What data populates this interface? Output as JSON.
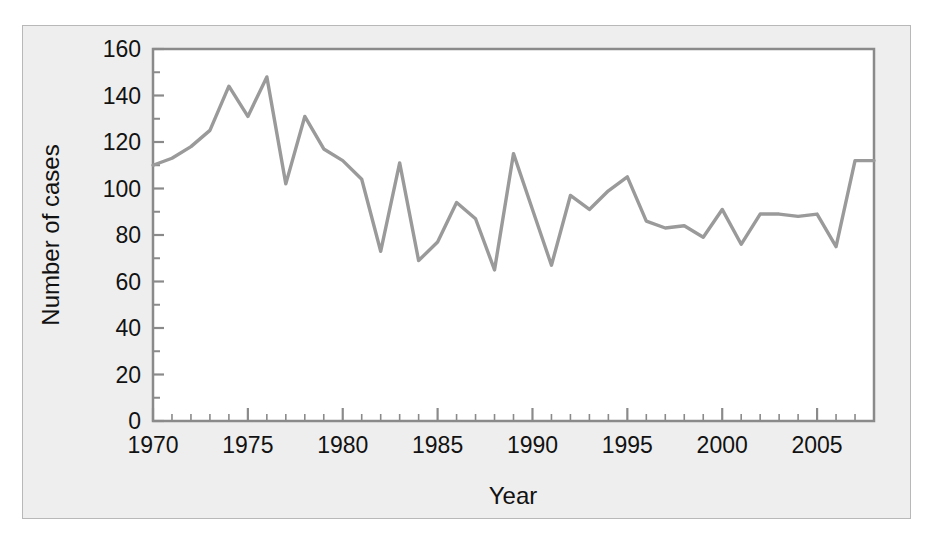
{
  "chart_data": {
    "type": "line",
    "title": "",
    "xlabel": "Year",
    "ylabel": "Number of cases",
    "xlim": [
      1970,
      2008
    ],
    "ylim": [
      0,
      160
    ],
    "grid": false,
    "legend": null,
    "line_color": "#9a9a9a",
    "x": [
      1970,
      1971,
      1972,
      1973,
      1974,
      1975,
      1976,
      1977,
      1978,
      1979,
      1980,
      1981,
      1982,
      1983,
      1984,
      1985,
      1986,
      1987,
      1988,
      1989,
      1990,
      1991,
      1992,
      1993,
      1994,
      1995,
      1996,
      1997,
      1998,
      1999,
      2000,
      2001,
      2002,
      2003,
      2004,
      2005,
      2006,
      2007,
      2008
    ],
    "values": [
      110,
      113,
      118,
      125,
      144,
      131,
      148,
      102,
      131,
      117,
      112,
      104,
      73,
      111,
      69,
      77,
      94,
      87,
      65,
      115,
      91,
      67,
      97,
      91,
      99,
      105,
      86,
      83,
      84,
      79,
      91,
      76,
      89,
      89,
      88,
      89,
      75,
      112,
      112
    ],
    "series": [
      {
        "name": "Number of cases",
        "values": [
          110,
          113,
          118,
          125,
          144,
          131,
          148,
          102,
          131,
          117,
          112,
          104,
          73,
          111,
          69,
          77,
          94,
          87,
          65,
          115,
          91,
          67,
          97,
          91,
          99,
          105,
          86,
          83,
          84,
          79,
          91,
          76,
          89,
          89,
          88,
          89,
          75,
          112,
          112
        ]
      }
    ],
    "x_tick_labels": [
      "1970",
      "1975",
      "1980",
      "1985",
      "1990",
      "1995",
      "2000",
      "2005"
    ],
    "x_tick_values": [
      1970,
      1975,
      1980,
      1985,
      1990,
      1995,
      2000,
      2005
    ],
    "x_minor_tick_step": 1,
    "y_tick_labels": [
      "0",
      "20",
      "40",
      "60",
      "80",
      "100",
      "120",
      "140",
      "160"
    ],
    "y_tick_values": [
      0,
      20,
      40,
      60,
      80,
      100,
      120,
      140,
      160
    ],
    "y_minor_tick_step": 10
  },
  "figure": {
    "background_color": "#eeeeee",
    "plot_background_color": "#ffffff",
    "axis_color": "#8a8a8a",
    "text_color": "#121212"
  }
}
